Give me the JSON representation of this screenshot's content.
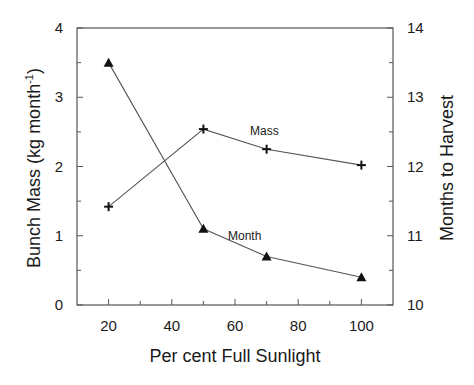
{
  "chart_data": {
    "type": "line",
    "title": "",
    "xlabel": "Per cent Full Sunlight",
    "ylabel": "Bunch Mass  (kg month⁻¹)",
    "ylabel_main": "Bunch Mass  (kg month",
    "ylabel_sup": "-1",
    "ylabel_close": ")",
    "y2label": "Months to Harvest",
    "xlim": [
      10,
      110
    ],
    "ylim": [
      0,
      4
    ],
    "y2lim": [
      10,
      14
    ],
    "xticks": [
      20,
      40,
      60,
      80,
      100
    ],
    "xticks_minor": [
      30,
      50,
      70,
      90
    ],
    "yticks": [
      0,
      1,
      2,
      3,
      4
    ],
    "y2ticks": [
      10,
      11,
      12,
      13,
      14
    ],
    "grid": false,
    "legend": "inline annotations",
    "x": [
      20,
      50,
      70,
      100
    ],
    "series": [
      {
        "name": "Mass",
        "axis": "left",
        "marker": "plus",
        "values": [
          1.42,
          2.54,
          2.25,
          2.02
        ],
        "label_pos": {
          "x": 250,
          "y": 135
        }
      },
      {
        "name": "Month",
        "axis": "right",
        "marker": "triangle",
        "values": [
          13.5,
          11.1,
          10.7,
          10.4
        ],
        "label_pos": {
          "x": 228,
          "y": 240
        }
      }
    ]
  },
  "colors": {
    "axis": "#555555",
    "marker": "#111111",
    "text": "#1a1a1a"
  }
}
